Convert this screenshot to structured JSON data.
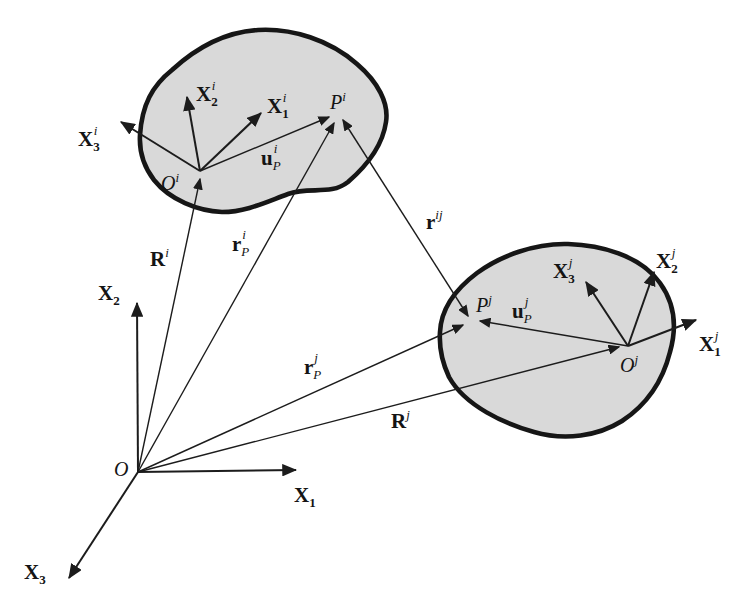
{
  "figure_type": "mechanics-diagram",
  "colors": {
    "background": "#ffffff",
    "body_fill": "#d9d9d9",
    "ink": "#1a1a1a"
  },
  "labels": {
    "O": {
      "base": "O"
    },
    "X1": {
      "base": "X",
      "sub": "1"
    },
    "X2": {
      "base": "X",
      "sub": "2"
    },
    "X3": {
      "base": "X",
      "sub": "3"
    },
    "Ri": {
      "base": "R",
      "sup": "i"
    },
    "Rj": {
      "base": "R",
      "sup": "j"
    },
    "rPi": {
      "base": "r",
      "sub": "P",
      "sup": "i"
    },
    "rPj": {
      "base": "r",
      "sub": "P",
      "sup": "j"
    },
    "rij": {
      "base": "r",
      "sup": "ij"
    },
    "Oi": {
      "base": "O",
      "sup": "i"
    },
    "Pi": {
      "base": "P",
      "sup": "i"
    },
    "uPi": {
      "base": "u",
      "sub": "P",
      "sup": "i"
    },
    "X1i": {
      "base": "X",
      "sub": "1",
      "sup": "i"
    },
    "X2i": {
      "base": "X",
      "sub": "2",
      "sup": "i"
    },
    "X3i": {
      "base": "X",
      "sub": "3",
      "sup": "i"
    },
    "Oj": {
      "base": "O",
      "sup": "j"
    },
    "Pj": {
      "base": "P",
      "sup": "j"
    },
    "uPj": {
      "base": "u",
      "sub": "P",
      "sup": "j"
    },
    "X1j": {
      "base": "X",
      "sub": "1",
      "sup": "j"
    },
    "X2j": {
      "base": "X",
      "sub": "2",
      "sup": "j"
    },
    "X3j": {
      "base": "X",
      "sub": "3",
      "sup": "j"
    }
  }
}
